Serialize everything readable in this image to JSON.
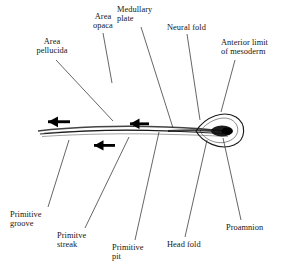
{
  "figure": {
    "kind": "anatomical-diagram",
    "background_color": "#ffffff",
    "ink_color": "#161616",
    "body": {
      "name": "blastoderm-oval",
      "shape": "ellipse",
      "center": [
        145,
        138
      ],
      "radius_x": 120,
      "radius_y": 77,
      "fill": "stippled"
    },
    "inner_region": {
      "name": "area-pellucida-region",
      "shape": "pear",
      "note": "lighter pear-shaped clear zone around the primitive streak"
    },
    "primitive_streak": {
      "name": "primitive-streak-axis",
      "y": 131,
      "x_start": 36,
      "x_end": 232
    },
    "arrows": [
      {
        "name": "migration-arrow-left",
        "x": 44,
        "y": 122,
        "length": 26,
        "direction": "left"
      },
      {
        "name": "migration-arrow-middle",
        "x": 126,
        "y": 124,
        "length": 22,
        "direction": "left"
      },
      {
        "name": "migration-arrow-lower",
        "x": 90,
        "y": 145,
        "length": 24,
        "direction": "left"
      }
    ]
  },
  "labels": [
    {
      "id": "area-pellucida",
      "text": "Area\npellucida",
      "leader_from": [
        56,
        60
      ],
      "leader_to": [
        112,
        121
      ]
    },
    {
      "id": "area-opaca",
      "text": "Area\nopaca",
      "leader_from": [
        103,
        33
      ],
      "leader_to": [
        112,
        82
      ]
    },
    {
      "id": "medullary-plate",
      "text": "Medullary\nplate",
      "leader_from": [
        140,
        27
      ],
      "leader_to": [
        172,
        128
      ]
    },
    {
      "id": "neural-fold",
      "text": "Neural fold",
      "leader_from": [
        186,
        34
      ],
      "leader_to": [
        199,
        120
      ]
    },
    {
      "id": "anterior-limit",
      "text": "Anterior limit\nof mesoderm",
      "leader_from": [
        234,
        60
      ],
      "leader_to": [
        222,
        112
      ]
    },
    {
      "id": "primitive-groove",
      "text": "Primitive\ngroove",
      "leader_from": [
        48,
        208
      ],
      "leader_to": [
        68,
        139
      ]
    },
    {
      "id": "primitive-streak",
      "text": "Primitve\nstreak",
      "leader_from": [
        84,
        229
      ],
      "leader_to": [
        128,
        136
      ]
    },
    {
      "id": "primitive-pit",
      "text": "Primitive\npit",
      "leader_from": [
        134,
        241
      ],
      "leader_to": [
        158,
        131
      ]
    },
    {
      "id": "head-fold",
      "text": "Head fold",
      "leader_from": [
        184,
        238
      ],
      "leader_to": [
        206,
        139
      ]
    },
    {
      "id": "proamnion",
      "text": "Proamnion",
      "leader_from": [
        240,
        221
      ],
      "leader_to": [
        222,
        137
      ]
    }
  ]
}
